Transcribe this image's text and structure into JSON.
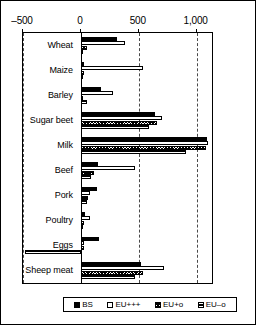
{
  "chart_data": {
    "type": "bar",
    "orientation": "horizontal",
    "title": "",
    "xlabel": "",
    "ylabel": "",
    "xlim": [
      -500,
      1150
    ],
    "xticks": [
      -500,
      0,
      500,
      1000
    ],
    "xticklabels": [
      "–500",
      "0",
      "500",
      "1,000"
    ],
    "grid": true,
    "gridlines_at": [
      -500,
      500,
      1000
    ],
    "legend_position": "bottom",
    "categories": [
      "Wheat",
      "Maize",
      "Barley",
      "Sugar beet",
      "Milk",
      "Beef",
      "Pork",
      "Poultry",
      "Eggs",
      "Sheep meat"
    ],
    "series": [
      {
        "name": "BS",
        "fill": "solid-black",
        "color": "#000000",
        "values": [
          310,
          30,
          170,
          640,
          1090,
          150,
          135,
          35,
          160,
          520
        ]
      },
      {
        "name": "EU+++",
        "fill": "white-open",
        "color": "#ffffff",
        "values": [
          385,
          535,
          280,
          700,
          1100,
          470,
          75,
          80,
          30,
          720
        ]
      },
      {
        "name": "EU+o",
        "fill": "crosshatch",
        "color": "#808080",
        "values": [
          55,
          25,
          15,
          655,
          1080,
          110,
          60,
          30,
          25,
          535
        ]
      },
      {
        "name": "EU–o",
        "fill": "dark-lined",
        "color": "#1a1a1a",
        "values": [
          10,
          20,
          55,
          590,
          910,
          90,
          55,
          20,
          -480,
          465
        ]
      }
    ]
  },
  "legend": {
    "items": [
      {
        "label": "BS"
      },
      {
        "label": "EU+++"
      },
      {
        "label": "EU+o"
      },
      {
        "label": "EU–o"
      }
    ]
  }
}
